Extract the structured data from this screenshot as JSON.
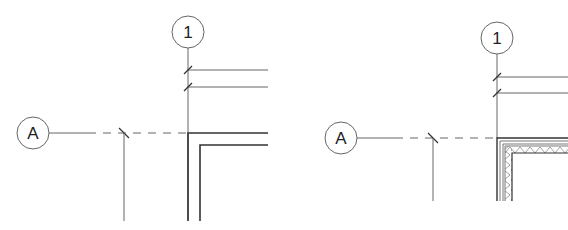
{
  "diagram": {
    "type": "architectural-plan-detail",
    "colors": {
      "line": "#555555",
      "heavy": "#333333",
      "hatch": "#777777",
      "background": "#ffffff"
    },
    "panels": [
      {
        "name": "left",
        "grid_bubbles": [
          {
            "label": "1",
            "cx": 188,
            "cy": 32,
            "r": 16
          },
          {
            "label": "A",
            "cx": 33,
            "cy": 133,
            "r": 16
          }
        ],
        "wall_style": "plain-double-line"
      },
      {
        "name": "right",
        "grid_bubbles": [
          {
            "label": "1",
            "cx": 497,
            "cy": 38,
            "r": 16
          },
          {
            "label": "A",
            "cx": 341,
            "cy": 138,
            "r": 16
          }
        ],
        "wall_style": "hatched-insulation"
      }
    ]
  }
}
